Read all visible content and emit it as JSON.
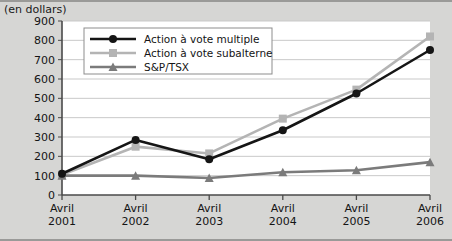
{
  "header": {
    "title": "(en dollars)"
  },
  "chart_data": {
    "type": "line",
    "title": "(en dollars)",
    "xlabel": "",
    "ylabel": "",
    "categories": [
      "Avril 2001",
      "Avril 2002",
      "Avril 2003",
      "Avril 2004",
      "Avril 2005",
      "Avril 2006"
    ],
    "category_lines": [
      [
        "Avril",
        "2001"
      ],
      [
        "Avril",
        "2002"
      ],
      [
        "Avril",
        "2003"
      ],
      [
        "Avril",
        "2004"
      ],
      [
        "Avril",
        "2005"
      ],
      [
        "Avril",
        "2006"
      ]
    ],
    "ylim": [
      0,
      900
    ],
    "ytick_step": 100,
    "yticks": [
      0,
      100,
      200,
      300,
      400,
      500,
      600,
      700,
      800,
      900
    ],
    "grid": true,
    "legend_position": "top-left-inside",
    "series": [
      {
        "name": "Action à vote multiple",
        "color": "#151515",
        "marker": "circle",
        "values": [
          110,
          285,
          185,
          335,
          525,
          750
        ]
      },
      {
        "name": "Action à vote subalterne",
        "color": "#b4b4b4",
        "marker": "square",
        "values": [
          105,
          250,
          215,
          395,
          545,
          820
        ]
      },
      {
        "name": "S&P/TSX",
        "color": "#7b7b7b",
        "marker": "triangle",
        "values": [
          100,
          100,
          88,
          118,
          128,
          170
        ]
      }
    ]
  },
  "colors": {
    "background": "#d6d6d4",
    "plot_background": "#ffffff",
    "axis": "#4a4a4a",
    "gridline": "#c9c9c9",
    "frame_border": "#9a9a98"
  }
}
